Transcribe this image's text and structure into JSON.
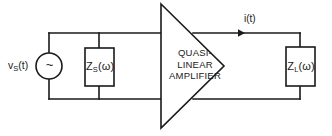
{
  "figure": {
    "kind": "circuit-diagram",
    "title_visible": false,
    "background_color": "#ffffff",
    "ink_color": "#1a1a1a"
  },
  "source": {
    "label_prefix": "v",
    "label_sub": "S",
    "label_suffix": "(t)",
    "symbol": "~",
    "symbol_name": "ac-source-tilde"
  },
  "source_impedance": {
    "label_prefix": "Z",
    "label_sub": "S",
    "label_suffix": "(ω)"
  },
  "load_impedance": {
    "label_prefix": "Z",
    "label_sub": "L",
    "label_suffix": "(ω)"
  },
  "amplifier": {
    "line1": "QUASI-",
    "line2": "LINEAR",
    "line3": "AMPLIFIER"
  },
  "current": {
    "label": "i(t)",
    "direction": "right"
  }
}
